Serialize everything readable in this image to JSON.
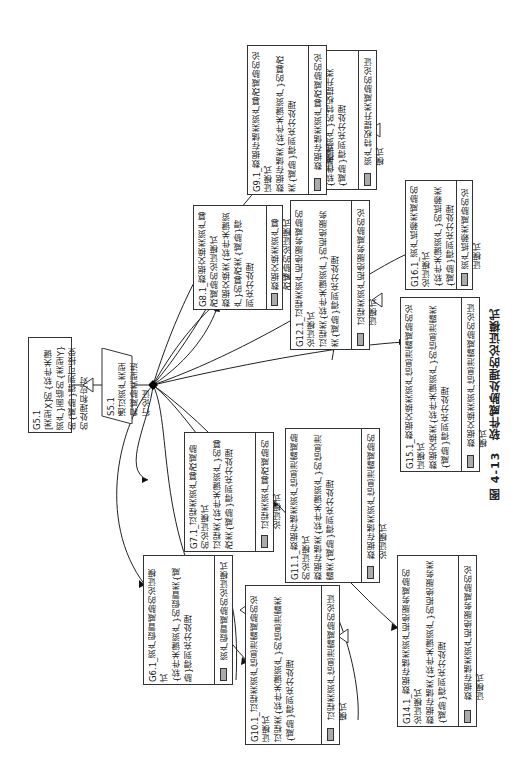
{
  "caption": "图 4-13　软件威胁处理的论证模式",
  "root_goal": {
    "id": "G5.1",
    "text": "[类型X]的{软件关键资产}面临的{类型Y}的{威胁}得到可接受的处理和应对"
  },
  "strategy": {
    "id": "S5.1",
    "text": "通过资产类型和威胁类型进行论证"
  },
  "goals": [
    {
      "id": "G6.1",
      "title": "G6.1_资产假冒威胁的论证模式",
      "text": "{软件关键资产}的假冒类{威胁}得到充分处理",
      "module": "资产假冒威胁的论证模式"
    },
    {
      "id": "G7.1",
      "title": "G7.1_过程类资产篡改威胁的论证模式",
      "text": "过程类{软件关键资产}的篡改类{威胁}得到充分处理",
      "module": "过程类资产篡改威胁的论证模式"
    },
    {
      "id": "G8.1",
      "title": "G8.1_数据交换类资产篡改威胁的论证模式",
      "text": "数据交换类{软件关键资产}的篡改类{威胁}得到充分处理",
      "module": "数据交换类资产篡改威胁的论证模式"
    },
    {
      "id": "G9.1",
      "title": "G9.1_数据存储类资产篡改威胁的论证模式",
      "text": "数据存储类{软件关键资产}的篡改类{威胁}得到充分处理",
      "module": "数据存储类资产篡改威胁的论证模式"
    },
    {
      "id": "G10.1",
      "title": "G10.1_过程类资产信息泄露威胁的论证模式",
      "text": "过程类{软件关键资产}的信息泄露类{威胁}得到充分处理",
      "module": "过程类资产信息泄露威胁的论证模式"
    },
    {
      "id": "G11.1",
      "title": "G11.1_数据存储类资产信息泄露威胁的论证模式",
      "text": "数据存储类{软件关键资产}的信息泄露类{威胁}得到充分处理",
      "module": "数据存储类资产信息泄露威胁的论证模式"
    },
    {
      "id": "G12.1",
      "title": "G12.1_过程类资产拒绝服务威胁的论证模式",
      "text": "过程类{软件关键资产}的拒绝服务类{威胁}得到充分处理",
      "module": "过程类资产拒绝服务威胁的论证模式"
    },
    {
      "id": "G13.1",
      "title": "G13.1_资产特权提升类威胁的论证模式",
      "text": "{软件关键资产}的特权提升类{威胁}得到充分处理",
      "module": "资产特权提升类威胁的论证模式"
    },
    {
      "id": "G14.1",
      "title": "G14.1_数据存储类资产拒绝服务威胁的论证模式",
      "text": "数据存储类{软件关键资产}的拒绝服务类{威胁}得到充分处理",
      "module": "数据存储类资产拒绝服务威胁的论证模式"
    },
    {
      "id": "G15.1",
      "title": "G15.1_数据交换类资产信息泄露威胁的论证模式",
      "text": "数据交换类{软件关键资产}的信息泄露类{威胁}得到充分处理",
      "module": "数据交换类资产信息泄露威胁的论证模式"
    },
    {
      "id": "G16.1",
      "title": "G16.1_资产抵赖类威胁的论证模式",
      "text": "{软件关键资产}的抵赖类{威胁}得到充分处理",
      "module": "资产抵赖类威胁的论证模式"
    }
  ]
}
